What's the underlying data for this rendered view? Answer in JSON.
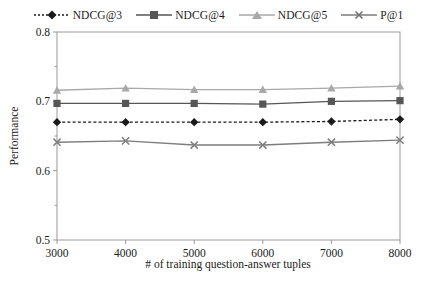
{
  "chart_data": {
    "type": "line",
    "title": "",
    "xlabel": "# of training question-answer tuples",
    "ylabel": "Performance",
    "x": [
      3000,
      4000,
      5000,
      6000,
      7000,
      8000
    ],
    "xticklabels": [
      "3000",
      "4000",
      "5000",
      "6000",
      "7000",
      "8000"
    ],
    "xlim": [
      3000,
      8000
    ],
    "ylim": [
      0.5,
      0.8
    ],
    "yticks": [
      0.5,
      0.6,
      0.7,
      0.8
    ],
    "yticklabels": [
      "0.5",
      "0.6",
      "0.7",
      "0.8"
    ],
    "minor_yticks": [
      0.55,
      0.65,
      0.75
    ],
    "grid": false,
    "legend_position": "top-center",
    "series": [
      {
        "name": "NDCG@3",
        "marker": "diamond",
        "linestyle": "dotted",
        "color": "#1a1a1a",
        "values": [
          0.67,
          0.67,
          0.67,
          0.67,
          0.671,
          0.674
        ]
      },
      {
        "name": "NDCG@4",
        "marker": "square",
        "linestyle": "solid",
        "color": "#565656",
        "values": [
          0.697,
          0.697,
          0.697,
          0.696,
          0.7,
          0.701
        ]
      },
      {
        "name": "NDCG@5",
        "marker": "triangle",
        "linestyle": "solid",
        "color": "#a8a8a8",
        "values": [
          0.716,
          0.719,
          0.717,
          0.717,
          0.719,
          0.722
        ]
      },
      {
        "name": "P@1",
        "marker": "x",
        "linestyle": "solid",
        "color": "#7d7d7d",
        "values": [
          0.641,
          0.643,
          0.637,
          0.637,
          0.641,
          0.644
        ]
      }
    ]
  },
  "legend": {
    "entries": [
      {
        "label": "NDCG@3"
      },
      {
        "label": "NDCG@4"
      },
      {
        "label": "NDCG@5"
      },
      {
        "label": "P@1"
      }
    ]
  }
}
